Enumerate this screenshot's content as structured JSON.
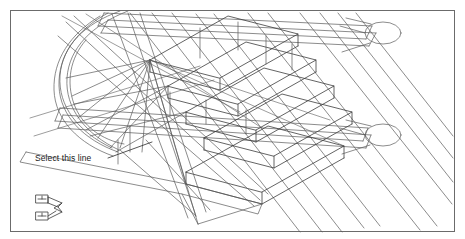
{
  "drawing": {
    "title": "Isometric spiral staircase CAD view",
    "background_color": "#ffffff",
    "border_color": "#6b6b6b",
    "line_color": "#5a5a5a",
    "highlight_color": "#2b2b2b",
    "border": {
      "x": 10,
      "y": 10,
      "width": 445,
      "height": 222
    }
  },
  "annotations": [
    {
      "name": "select-this-line",
      "text": "Select this line",
      "x": 35,
      "y": 153,
      "leader": {
        "from_x": 108,
        "from_y": 158,
        "to_x": 150,
        "to_y": 143
      }
    }
  ],
  "ucs_icon": {
    "name": "ucs-isometric-icon",
    "x": 30,
    "y": 192,
    "width": 42,
    "height": 32,
    "label_boxes": 2
  },
  "geometry": {
    "posts": [
      {
        "name": "post-upper-right",
        "cx": 383,
        "cy": 33,
        "rx": 18,
        "ry": 11
      },
      {
        "name": "post-lower-right",
        "cx": 383,
        "cy": 135,
        "rx": 18,
        "ry": 11
      }
    ],
    "steps_count": 5,
    "spiral_arcs": 4,
    "stringer_rails": 4
  }
}
